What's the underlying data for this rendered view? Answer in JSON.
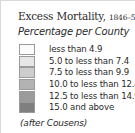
{
  "legend": {
    "title": "Excess Mortality,",
    "title_years": "1846–50",
    "subtitle": "Percentage per County",
    "items": [
      {
        "label": "less than 4.9",
        "color": "#fbfbfb"
      },
      {
        "label": "5.0 to less than 7.4",
        "color": "#e6e6e6"
      },
      {
        "label": "7.5 to less than 9.9",
        "color": "#cdcdcd"
      },
      {
        "label": "10.0 to less than 12.4",
        "color": "#b3b3b3"
      },
      {
        "label": "12.5 to less than 14.9",
        "color": "#9b9b9b"
      },
      {
        "label": "15.0 and above",
        "color": "#7f7f7f"
      }
    ],
    "credit": "(after Cousens)"
  }
}
